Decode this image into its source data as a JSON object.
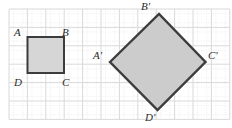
{
  "figure": {
    "background_color": "#ffffff",
    "grid": {
      "major_spacing": 18.4,
      "minor_spacing": 9.2,
      "major_color": "#d9d9d9",
      "minor_color": "#e6e6e6",
      "origin_x": 9,
      "origin_y": 9,
      "columns": 12,
      "rows": 6
    },
    "shapes": [
      {
        "name": "square-abcd",
        "kind": "square",
        "fill_color": "#d6d6d6",
        "stroke_color": "#3c3c3c",
        "stroke_width": 2,
        "points": "27.5,37 64,37 64,73 27.5,73",
        "vertices": [
          {
            "label": "A",
            "x": 27.5,
            "y": 37
          },
          {
            "label": "B",
            "x": 64,
            "y": 37
          },
          {
            "label": "C",
            "x": 64,
            "y": 73
          },
          {
            "label": "D",
            "x": 27.5,
            "y": 73
          }
        ]
      },
      {
        "name": "diamond-a-prime-b-prime-c-prime-d-prime",
        "kind": "rotated-square",
        "fill_color": "#cccccc",
        "stroke_color": "#3c3c3c",
        "stroke_width": 2.4,
        "points": "110,62 159,14 205.5,62 157.5,110",
        "vertices": [
          {
            "label": "A'",
            "x": 110,
            "y": 62
          },
          {
            "label": "B'",
            "x": 159,
            "y": 14
          },
          {
            "label": "C'",
            "x": 205.5,
            "y": 62
          },
          {
            "label": "D'",
            "x": 157.5,
            "y": 110
          }
        ]
      }
    ],
    "labels": [
      {
        "name": "label-a",
        "text": "A",
        "x": 14,
        "y": 27
      },
      {
        "name": "label-b",
        "text": "B",
        "x": 62,
        "y": 27
      },
      {
        "name": "label-c",
        "text": "C",
        "x": 62,
        "y": 77
      },
      {
        "name": "label-d",
        "text": "D",
        "x": 14,
        "y": 77
      },
      {
        "name": "label-a-prime",
        "text": "A'",
        "x": 93,
        "y": 50
      },
      {
        "name": "label-b-prime",
        "text": "B'",
        "x": 141,
        "y": 1
      },
      {
        "name": "label-c-prime",
        "text": "C'",
        "x": 208,
        "y": 50
      },
      {
        "name": "label-d-prime",
        "text": "D'",
        "x": 145,
        "y": 112
      }
    ]
  }
}
